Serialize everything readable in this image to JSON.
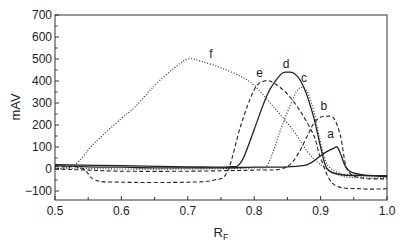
{
  "chart_data": {
    "type": "line",
    "title": "",
    "xlabel": "R_F",
    "xlabel_main": "R",
    "xlabel_sub": "F",
    "ylabel": "mAV",
    "xlim": [
      0.5,
      1.0
    ],
    "ylim": [
      -150,
      700
    ],
    "grid": false,
    "legend": "none (curves labeled inline a–f)",
    "x_ticks": [
      0.5,
      0.6,
      0.7,
      0.8,
      0.9,
      1.0
    ],
    "x_tick_labels": [
      "0.5",
      "0.6",
      "0.7",
      "0.8",
      "0.9",
      "1.0"
    ],
    "x_minor_ticks": [
      0.55,
      0.65,
      0.75,
      0.85,
      0.95
    ],
    "y_ticks": [
      -100,
      0,
      100,
      200,
      300,
      400,
      500,
      600,
      700
    ],
    "y_tick_labels": [
      "-100",
      "0",
      "100",
      "200",
      "300",
      "400",
      "500",
      "600",
      "700"
    ],
    "series": [
      {
        "name": "a",
        "style": "solid",
        "label_pos": [
          0.915,
          140
        ],
        "x": [
          0.5,
          0.55,
          0.6,
          0.65,
          0.7,
          0.75,
          0.8,
          0.85,
          0.88,
          0.9,
          0.91,
          0.92,
          0.925,
          0.93,
          0.94,
          0.96,
          1.0
        ],
        "y": [
          15,
          10,
          8,
          5,
          5,
          5,
          8,
          10,
          20,
          60,
          80,
          95,
          100,
          70,
          0,
          -25,
          -35
        ]
      },
      {
        "name": "b",
        "style": "dashed",
        "label_pos": [
          0.905,
          270
        ],
        "x": [
          0.5,
          0.55,
          0.6,
          0.7,
          0.8,
          0.84,
          0.86,
          0.88,
          0.89,
          0.9,
          0.91,
          0.92,
          0.93,
          0.94,
          0.96,
          1.0
        ],
        "y": [
          0,
          -5,
          -10,
          -10,
          -5,
          0,
          40,
          150,
          210,
          235,
          240,
          230,
          150,
          0,
          -40,
          -45
        ]
      },
      {
        "name": "c",
        "style": "dotted",
        "label_pos": [
          0.875,
          395
        ],
        "x": [
          0.5,
          0.6,
          0.7,
          0.8,
          0.82,
          0.84,
          0.86,
          0.87,
          0.88,
          0.89,
          0.9,
          0.91,
          0.93,
          0.96,
          1.0
        ],
        "y": [
          5,
          0,
          0,
          5,
          20,
          180,
          330,
          370,
          350,
          260,
          120,
          20,
          -20,
          -30,
          -30
        ]
      },
      {
        "name": "d",
        "style": "solid",
        "label_pos": [
          0.848,
          460
        ],
        "x": [
          0.5,
          0.6,
          0.7,
          0.76,
          0.78,
          0.8,
          0.82,
          0.84,
          0.85,
          0.86,
          0.87,
          0.88,
          0.89,
          0.9,
          0.91,
          0.93,
          0.96,
          1.0
        ],
        "y": [
          20,
          15,
          10,
          10,
          30,
          180,
          340,
          430,
          440,
          435,
          400,
          330,
          230,
          100,
          0,
          -25,
          -30,
          -30
        ]
      },
      {
        "name": "e",
        "style": "dashed",
        "label_pos": [
          0.808,
          420
        ],
        "x": [
          0.5,
          0.54,
          0.56,
          0.6,
          0.7,
          0.74,
          0.76,
          0.78,
          0.8,
          0.815,
          0.83,
          0.85,
          0.87,
          0.89,
          0.9,
          0.92,
          0.96,
          1.0
        ],
        "y": [
          10,
          5,
          -50,
          -60,
          -60,
          -50,
          -10,
          200,
          360,
          400,
          390,
          340,
          260,
          150,
          50,
          -70,
          -90,
          -90
        ]
      },
      {
        "name": "f",
        "style": "dotted",
        "label_pos": [
          0.735,
          505
        ],
        "x": [
          0.5,
          0.53,
          0.56,
          0.6,
          0.62,
          0.65,
          0.68,
          0.7,
          0.72,
          0.75,
          0.78,
          0.8,
          0.83,
          0.86,
          0.88,
          0.9,
          0.93,
          0.96,
          1.0
        ],
        "y": [
          0,
          20,
          120,
          230,
          280,
          380,
          460,
          500,
          490,
          460,
          420,
          380,
          280,
          170,
          80,
          20,
          -30,
          -40,
          -40
        ]
      }
    ]
  }
}
